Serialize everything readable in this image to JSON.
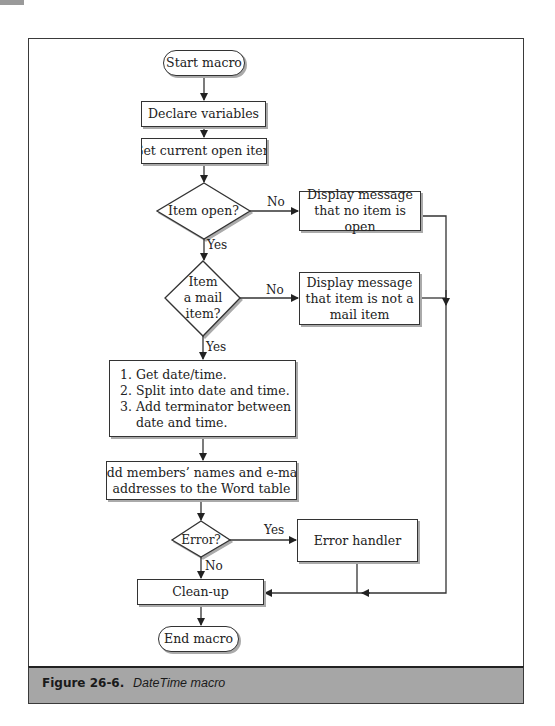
{
  "nodes": {
    "start": "Start macro",
    "declare": "Declare variables",
    "get_item": "Get current open item",
    "item_open": "Item open?",
    "msg_no_item_1": "Display message",
    "msg_no_item_2": "that no item is open",
    "mail_item_1": "Item",
    "mail_item_2": "a mail",
    "mail_item_3": "item?",
    "msg_not_mail_1": "Display message",
    "msg_not_mail_2": "that item is not a",
    "msg_not_mail_3": "mail item",
    "steps": [
      "1. Get date/time.",
      "2. Split into date and time.",
      "3. Add terminator between",
      "    date and time."
    ],
    "add_members_1": "Add members’ names and e-mail",
    "add_members_2": "addresses to the Word table",
    "error": "Error?",
    "error_handler": "Error handler",
    "cleanup": "Clean-up",
    "end": "End macro"
  },
  "edge_labels": {
    "item_open_no": "No",
    "item_open_yes": "Yes",
    "mail_no": "No",
    "mail_yes": "Yes",
    "error_yes": "Yes",
    "error_no": "No"
  },
  "caption": {
    "label": "Figure 26-6.",
    "title": "DateTime macro"
  }
}
